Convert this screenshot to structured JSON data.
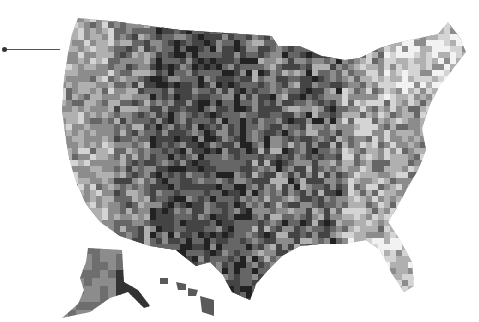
{
  "map": {
    "type": "choropleth",
    "region": "United States counties",
    "color_scale": "grayscale",
    "palette": [
      "#f2f2f2",
      "#d4d4d4",
      "#b0b0b0",
      "#8c8c8c",
      "#666666",
      "#444444",
      "#222222"
    ],
    "background": "#ffffff",
    "insets": [
      "Alaska",
      "Hawaii"
    ],
    "annotation": {
      "type": "leader-line",
      "label": ""
    }
  }
}
